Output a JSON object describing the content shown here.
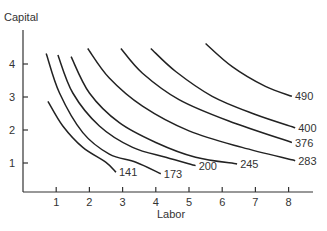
{
  "chart_data": {
    "type": "line",
    "title": "",
    "xlabel": "Labor",
    "ylabel": "Capital",
    "xlim": [
      0,
      8.7
    ],
    "ylim": [
      0,
      4.8
    ],
    "x_ticks": [
      "1",
      "2",
      "3",
      "4",
      "5",
      "6",
      "7",
      "8"
    ],
    "y_ticks": [
      "1",
      "2",
      "3",
      "4"
    ],
    "grid": false,
    "legend": "inline labels at curve ends",
    "series": [
      {
        "name": "141",
        "points": [
          [
            0.75,
            2.75
          ],
          [
            1.2,
            2.0
          ],
          [
            1.8,
            1.35
          ],
          [
            2.5,
            0.9
          ],
          [
            2.8,
            0.6
          ]
        ]
      },
      {
        "name": "173",
        "points": [
          [
            0.7,
            4.2
          ],
          [
            1.1,
            3.0
          ],
          [
            1.8,
            1.8
          ],
          [
            2.6,
            1.15
          ],
          [
            3.4,
            0.9
          ],
          [
            4.15,
            0.55
          ]
        ]
      },
      {
        "name": "200",
        "points": [
          [
            1.05,
            4.15
          ],
          [
            1.5,
            3.0
          ],
          [
            2.3,
            2.0
          ],
          [
            3.3,
            1.35
          ],
          [
            4.3,
            1.05
          ],
          [
            5.2,
            0.8
          ]
        ]
      },
      {
        "name": "245",
        "points": [
          [
            1.45,
            4.1
          ],
          [
            2.0,
            3.0
          ],
          [
            2.9,
            2.1
          ],
          [
            4.0,
            1.5
          ],
          [
            5.2,
            1.05
          ],
          [
            6.45,
            0.85
          ]
        ]
      },
      {
        "name": "283",
        "points": [
          [
            1.95,
            4.35
          ],
          [
            2.6,
            3.45
          ],
          [
            3.6,
            2.6
          ],
          [
            5.0,
            1.85
          ],
          [
            6.6,
            1.35
          ],
          [
            8.2,
            0.95
          ]
        ]
      },
      {
        "name": "376",
        "points": [
          [
            2.95,
            4.35
          ],
          [
            3.6,
            3.6
          ],
          [
            4.7,
            2.8
          ],
          [
            6.2,
            2.15
          ],
          [
            8.1,
            1.5
          ]
        ]
      },
      {
        "name": "400",
        "points": [
          [
            3.85,
            4.35
          ],
          [
            4.6,
            3.65
          ],
          [
            5.7,
            2.9
          ],
          [
            7.0,
            2.35
          ],
          [
            8.2,
            1.95
          ]
        ]
      },
      {
        "name": "490",
        "points": [
          [
            5.5,
            4.5
          ],
          [
            6.3,
            3.8
          ],
          [
            7.3,
            3.2
          ],
          [
            8.1,
            2.9
          ]
        ]
      }
    ]
  }
}
